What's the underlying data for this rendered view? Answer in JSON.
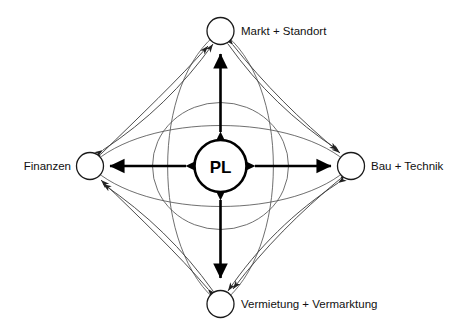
{
  "diagram": {
    "center": {
      "label": "PL",
      "shape": "circle"
    },
    "nodes": [
      {
        "id": "top",
        "label": "Markt + Standort",
        "position": "top",
        "label_side": "right"
      },
      {
        "id": "left",
        "label": "Finanzen",
        "position": "left",
        "label_side": "left"
      },
      {
        "id": "right",
        "label": "Bau + Technik",
        "position": "right",
        "label_side": "right"
      },
      {
        "id": "bottom",
        "label": "Vermietung + Vermarktung",
        "position": "bottom",
        "label_side": "right"
      }
    ],
    "connections": {
      "radial": [
        {
          "from": "PL",
          "to": "Markt + Standort",
          "style": "thick-double-arrow"
        },
        {
          "from": "PL",
          "to": "Finanzen",
          "style": "thick-double-arrow"
        },
        {
          "from": "PL",
          "to": "Bau + Technik",
          "style": "thick-double-arrow"
        },
        {
          "from": "PL",
          "to": "Vermietung + Vermarktung",
          "style": "thick-double-arrow"
        }
      ],
      "peripheral": [
        {
          "from": "Finanzen",
          "to": "Markt + Standort",
          "style": "thin-curved-double-arrow",
          "count": 2
        },
        {
          "from": "Markt + Standort",
          "to": "Bau + Technik",
          "style": "thin-curved-double-arrow",
          "count": 2
        },
        {
          "from": "Bau + Technik",
          "to": "Vermietung + Vermarktung",
          "style": "thin-curved-double-arrow",
          "count": 2
        },
        {
          "from": "Vermietung + Vermarktung",
          "to": "Finanzen",
          "style": "thin-curved-double-arrow",
          "count": 2
        }
      ]
    },
    "colors": {
      "background": "#ffffff",
      "stroke": "#000000",
      "thin_stroke": "#555555",
      "text": "#111111"
    }
  }
}
